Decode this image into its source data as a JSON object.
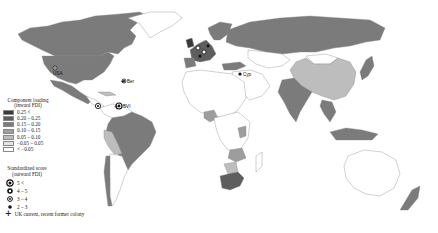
{
  "map": {
    "type": "choropleth-world",
    "colors": {
      "c1": "#3a3a3a",
      "c2": "#5e5e5e",
      "c3": "#7b7b7b",
      "c4": "#9d9d9d",
      "c5": "#bdbdbd",
      "c6": "#e3e3e3",
      "c7": "#ffffff",
      "ocean": "#ffffff"
    },
    "labels": [
      {
        "id": "usa",
        "text": "USA"
      },
      {
        "id": "ber",
        "text": "Ber"
      },
      {
        "id": "bvi",
        "text": "BVI"
      },
      {
        "id": "cyp",
        "text": "Cyp"
      }
    ]
  },
  "legend": {
    "loading_title": "Component loading",
    "loading_subtitle": "(inward FDI)",
    "loading_classes": [
      {
        "label": "0.25 <",
        "color": "#3a3a3a"
      },
      {
        "label": "0.20 – 0.25",
        "color": "#5e5e5e"
      },
      {
        "label": "0.15 – 0.20",
        "color": "#7b7b7b"
      },
      {
        "label": "0.10 – 0.15",
        "color": "#9d9d9d"
      },
      {
        "label": "0.05 – 0.10",
        "color": "#bdbdbd"
      },
      {
        "label": "−0.05 – 0.05",
        "color": "#e3e3e3"
      },
      {
        "label": "< −0.05",
        "color": "#ffffff"
      }
    ],
    "score_title": "Standardized score",
    "score_subtitle": "(outward FDI)",
    "score_classes": [
      {
        "label": "5 <"
      },
      {
        "label": "4 – 5"
      },
      {
        "label": "3 – 4"
      },
      {
        "label": "2 – 3"
      }
    ],
    "uk_label": "UK current, recent former colony",
    "uk_symbol": "+"
  }
}
